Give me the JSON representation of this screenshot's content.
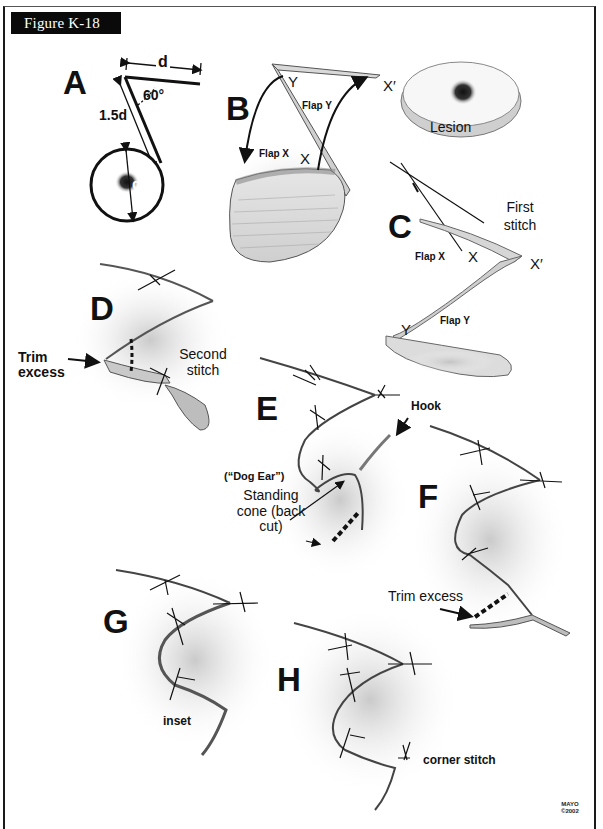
{
  "figure": {
    "title": "Figure K-18",
    "copyright": {
      "line1": "MAYO",
      "line2": "©2002"
    }
  },
  "panels": {
    "A": {
      "letter": "A",
      "dim_d_top": "d",
      "angle": "60°",
      "dim_side": "1.5d",
      "dim_circle": "d"
    },
    "B": {
      "letter": "B",
      "point_y": "Y",
      "point_x": "X",
      "point_x_prime": "X′",
      "flap_y": "Flap Y",
      "flap_x": "Flap X"
    },
    "lesion": {
      "label": "Lesion"
    },
    "C": {
      "letter": "C",
      "first_stitch": "First stitch",
      "flap_x": "Flap X",
      "point_x": "X",
      "point_x_prime": "X′",
      "point_y": "Y",
      "flap_y": "Flap Y"
    },
    "D": {
      "letter": "D",
      "trim_excess": "Trim excess",
      "second_stitch": "Second stitch"
    },
    "E": {
      "letter": "E",
      "hook": "Hook",
      "dog_ear": "(“Dog Ear”)",
      "standing_cone": "Standing cone (back cut)"
    },
    "F": {
      "letter": "F",
      "trim_excess": "Trim excess"
    },
    "G": {
      "letter": "G",
      "inset": "inset"
    },
    "H": {
      "letter": "H",
      "corner_stitch": "corner stitch"
    }
  },
  "colors": {
    "ink": "#111111",
    "tissue": "#9a9a9a",
    "shadow": "#c8c8c8",
    "label_bg": "#0a0a0a"
  }
}
